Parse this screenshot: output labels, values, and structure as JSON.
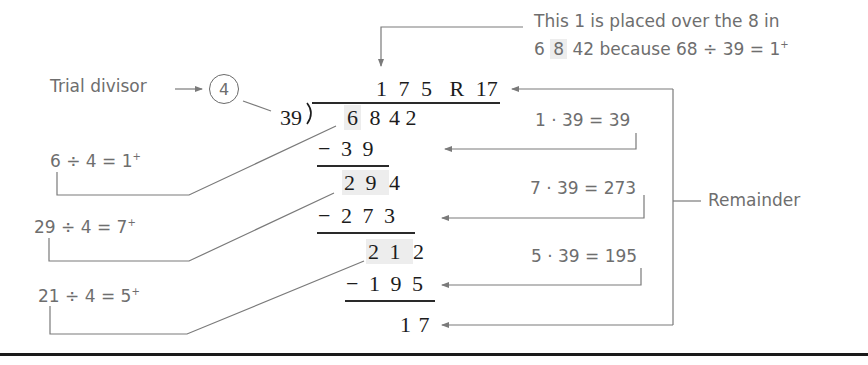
{
  "division": {
    "divisor": "39",
    "dividend": "6842",
    "quotient": "175",
    "remainder": "17",
    "quotient_line": [
      "1",
      "7",
      "5",
      "R",
      "17"
    ],
    "dividend_digits": [
      "6",
      "8",
      "4",
      "2"
    ],
    "steps": [
      {
        "subtract": [
          "−",
          "3",
          "9"
        ],
        "result": [
          "2",
          "9",
          "4"
        ]
      },
      {
        "subtract": [
          "−",
          "2",
          "7",
          "3"
        ],
        "result": [
          "2",
          "1",
          "2"
        ]
      },
      {
        "subtract": [
          "−",
          "1",
          "9",
          "5"
        ],
        "result": [
          "1",
          "7"
        ]
      }
    ],
    "divisor_label": "39)"
  },
  "trial_divisor": {
    "label": "Trial divisor",
    "value": "4"
  },
  "left_annotations": [
    {
      "lhs": "6 ÷ 4 = 1",
      "sup": "+"
    },
    {
      "lhs": "29 ÷ 4 = 7",
      "sup": "+"
    },
    {
      "lhs": "21 ÷ 4 = 5",
      "sup": "+"
    }
  ],
  "right_annotations": [
    {
      "text": "1 · 39 = 39"
    },
    {
      "text": "7 · 39 = 273"
    },
    {
      "text": "5 · 39 = 195"
    }
  ],
  "top_note": {
    "line1": "This 1 is placed over the 8 in",
    "line2_a": "6",
    "line2_b": "8",
    "line2_c": "42 because 68 ÷ 39 = 1",
    "line2_sup": "+"
  },
  "remainder_label": "Remainder",
  "colors": {
    "annotation_text": "#6e6e6e",
    "math_text": "#1c1c1c",
    "leader_lines": "#7a7a7a",
    "highlight": "#ededed"
  }
}
